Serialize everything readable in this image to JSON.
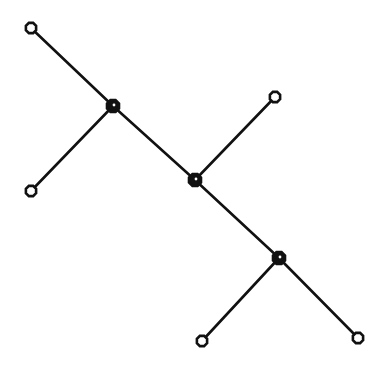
{
  "diagram": {
    "type": "tree",
    "colors": {
      "line": "#111111",
      "background": "#ffffff"
    },
    "nodes": [
      {
        "id": "A",
        "kind": "leaf"
      },
      {
        "id": "B",
        "kind": "internal"
      },
      {
        "id": "C",
        "kind": "leaf"
      },
      {
        "id": "D",
        "kind": "leaf"
      },
      {
        "id": "E",
        "kind": "internal"
      },
      {
        "id": "F",
        "kind": "internal"
      },
      {
        "id": "G",
        "kind": "leaf"
      },
      {
        "id": "H",
        "kind": "leaf"
      }
    ],
    "edges": [
      {
        "from": "A",
        "to": "B"
      },
      {
        "from": "B",
        "to": "C"
      },
      {
        "from": "B",
        "to": "E"
      },
      {
        "from": "E",
        "to": "D"
      },
      {
        "from": "E",
        "to": "F"
      },
      {
        "from": "F",
        "to": "G"
      },
      {
        "from": "F",
        "to": "H"
      }
    ]
  }
}
